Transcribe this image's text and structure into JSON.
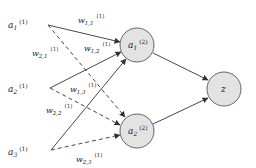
{
  "diagram": {
    "type": "neural-network",
    "input_nodes": [
      {
        "id": "a1_1",
        "label": "a",
        "sub": "1",
        "sup": "(1)"
      },
      {
        "id": "a2_1",
        "label": "a",
        "sub": "2",
        "sup": "(1)"
      },
      {
        "id": "a3_1",
        "label": "a",
        "sub": "3",
        "sup": "(1)"
      }
    ],
    "hidden_nodes": [
      {
        "id": "a1_2",
        "label": "a",
        "sub": "1",
        "sup": "(2)"
      },
      {
        "id": "a2_2",
        "label": "a",
        "sub": "2",
        "sup": "(2)"
      }
    ],
    "output_node": {
      "id": "z",
      "label": "z"
    },
    "weights": [
      {
        "label": "w",
        "sub": "1,1",
        "sup": "(1)",
        "from": "a1_1",
        "to": "a1_2",
        "style": "solid"
      },
      {
        "label": "w",
        "sub": "1,2",
        "sup": "(1)",
        "from": "a2_1",
        "to": "a1_2",
        "style": "solid"
      },
      {
        "label": "w",
        "sub": "1,3",
        "sup": "(1)",
        "from": "a3_1",
        "to": "a1_2",
        "style": "solid"
      },
      {
        "label": "w",
        "sub": "2,1",
        "sup": "(1)",
        "from": "a1_1",
        "to": "a2_2",
        "style": "dashed"
      },
      {
        "label": "w",
        "sub": "2,2",
        "sup": "(1)",
        "from": "a2_1",
        "to": "a2_2",
        "style": "dashed"
      },
      {
        "label": "w",
        "sub": "2,3",
        "sup": "(1)",
        "from": "a3_1",
        "to": "a2_2",
        "style": "dashed"
      }
    ],
    "colors": {
      "node_fill": "#e3e3e3",
      "node_stroke": "#555555",
      "edge": "#333333"
    }
  }
}
